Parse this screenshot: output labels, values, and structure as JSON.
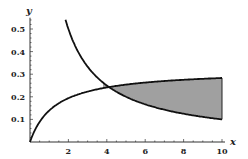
{
  "chart_data": {
    "type": "area",
    "title": "",
    "xlabel": "x",
    "ylabel": "y",
    "xlim": [
      0,
      10
    ],
    "ylim": [
      0,
      0.55
    ],
    "x_ticks": [
      "2",
      "4",
      "6",
      "8",
      "10"
    ],
    "y_ticks": [
      "0.1",
      "0.2",
      "0.3",
      "0.4",
      "0.5"
    ],
    "grid": false,
    "legend": "none",
    "series": [
      {
        "name": "decreasing curve (y = 1/x)",
        "x": [
          1.85,
          2,
          3,
          4,
          5,
          6,
          7,
          8,
          9,
          10
        ],
        "values": [
          0.54,
          0.5,
          0.333,
          0.25,
          0.2,
          0.167,
          0.143,
          0.125,
          0.111,
          0.1
        ]
      },
      {
        "name": "increasing curve",
        "x": [
          0,
          0.5,
          1,
          2,
          3,
          4,
          5,
          6,
          7,
          8,
          9,
          10
        ],
        "values": [
          0,
          0.09,
          0.14,
          0.19,
          0.22,
          0.24,
          0.25,
          0.265,
          0.275,
          0.28,
          0.285,
          0.29
        ]
      }
    ],
    "shaded_region": {
      "between": [
        "increasing curve",
        "decreasing curve (y = 1/x)"
      ],
      "x_from": 3.8,
      "x_to": 10,
      "color": "#a0a0a0"
    },
    "colors": {
      "curve": "#111111",
      "fill": "#a0a0a0",
      "axis": "#333333"
    }
  }
}
